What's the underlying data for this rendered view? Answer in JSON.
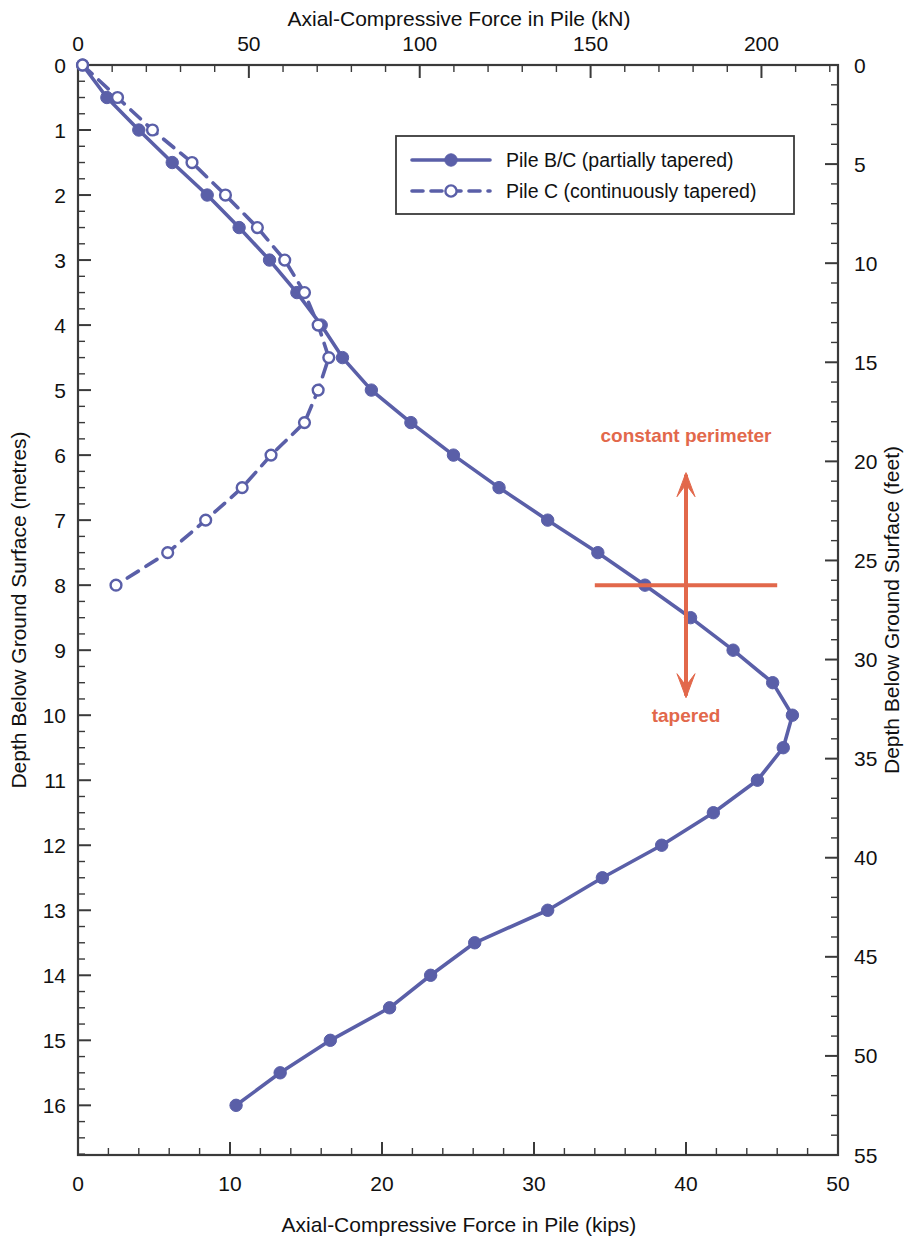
{
  "chart_data": {
    "type": "line",
    "title": "",
    "top_axis": {
      "label": "Axial-Compressive Force in Pile (kN)",
      "ticks": [
        0,
        50,
        100,
        150,
        200
      ],
      "range": [
        0,
        222.4
      ],
      "minor_interval": 10
    },
    "bottom_axis": {
      "label": "Axial-Compressive Force in Pile (kips)",
      "ticks": [
        0,
        10,
        20,
        30,
        40,
        50
      ],
      "range": [
        0,
        50
      ],
      "minor_interval": 2
    },
    "left_axis": {
      "label": "Depth Below Ground Surface (metres)",
      "ticks": [
        0,
        1,
        2,
        3,
        4,
        5,
        6,
        7,
        8,
        9,
        10,
        11,
        12,
        13,
        14,
        15,
        16
      ],
      "range": [
        0,
        16.764
      ],
      "minor_interval": 0.25
    },
    "right_axis": {
      "label": "Depth Below Ground Surface (feet)",
      "ticks": [
        0,
        5,
        10,
        15,
        20,
        25,
        30,
        35,
        40,
        45,
        50,
        55
      ],
      "range": [
        0,
        55
      ],
      "minor_interval": 1
    },
    "xlabel": "Axial-Compressive Force in Pile (kips)",
    "ylabel": "Depth Below Ground Surface (metres)",
    "grid": false,
    "legend_position": "top-center",
    "series": [
      {
        "name": "Pile B/C (partially tapered)",
        "style": "solid",
        "marker": "filled-circle",
        "color": "#5a5fa8",
        "points": [
          {
            "x": 0.3,
            "y": 0.0
          },
          {
            "x": 1.9,
            "y": 0.5
          },
          {
            "x": 4.0,
            "y": 1.0
          },
          {
            "x": 6.2,
            "y": 1.5
          },
          {
            "x": 8.5,
            "y": 2.0
          },
          {
            "x": 10.6,
            "y": 2.5
          },
          {
            "x": 12.6,
            "y": 3.0
          },
          {
            "x": 14.4,
            "y": 3.5
          },
          {
            "x": 16.0,
            "y": 4.0
          },
          {
            "x": 17.4,
            "y": 4.5
          },
          {
            "x": 19.3,
            "y": 5.0
          },
          {
            "x": 21.9,
            "y": 5.5
          },
          {
            "x": 24.7,
            "y": 6.0
          },
          {
            "x": 27.7,
            "y": 6.5
          },
          {
            "x": 30.9,
            "y": 7.0
          },
          {
            "x": 34.2,
            "y": 7.5
          },
          {
            "x": 37.3,
            "y": 8.0
          },
          {
            "x": 40.3,
            "y": 8.5
          },
          {
            "x": 43.1,
            "y": 9.0
          },
          {
            "x": 45.7,
            "y": 9.5
          },
          {
            "x": 47.0,
            "y": 10.0
          },
          {
            "x": 46.4,
            "y": 10.5
          },
          {
            "x": 44.7,
            "y": 11.0
          },
          {
            "x": 41.8,
            "y": 11.5
          },
          {
            "x": 38.4,
            "y": 12.0
          },
          {
            "x": 34.5,
            "y": 12.5
          },
          {
            "x": 30.9,
            "y": 13.0
          },
          {
            "x": 26.1,
            "y": 13.5
          },
          {
            "x": 23.2,
            "y": 14.0
          },
          {
            "x": 20.5,
            "y": 14.5
          },
          {
            "x": 16.6,
            "y": 15.0
          },
          {
            "x": 13.3,
            "y": 15.5
          },
          {
            "x": 10.4,
            "y": 16.0
          }
        ]
      },
      {
        "name": "Pile C (continuously tapered)",
        "style": "dashed",
        "marker": "open-circle",
        "color": "#5a5fa8",
        "points": [
          {
            "x": 0.3,
            "y": 0.0
          },
          {
            "x": 2.6,
            "y": 0.5
          },
          {
            "x": 4.9,
            "y": 1.0
          },
          {
            "x": 7.5,
            "y": 1.5
          },
          {
            "x": 9.7,
            "y": 2.0
          },
          {
            "x": 11.8,
            "y": 2.5
          },
          {
            "x": 13.6,
            "y": 3.0
          },
          {
            "x": 14.9,
            "y": 3.5
          },
          {
            "x": 15.8,
            "y": 4.0
          },
          {
            "x": 16.5,
            "y": 4.5
          },
          {
            "x": 15.8,
            "y": 5.0
          },
          {
            "x": 14.9,
            "y": 5.5
          },
          {
            "x": 12.7,
            "y": 6.0
          },
          {
            "x": 10.8,
            "y": 6.5
          },
          {
            "x": 8.4,
            "y": 7.0
          },
          {
            "x": 5.9,
            "y": 7.5
          },
          {
            "x": 2.5,
            "y": 8.0
          }
        ]
      }
    ],
    "annotations": [
      {
        "id": "constant-perimeter",
        "text": "constant perimeter",
        "color": "#e2684b",
        "x": 40.0,
        "y_text": 5.8,
        "y_from": 8.0,
        "y_to": 6.3,
        "direction": "up"
      },
      {
        "id": "tapered",
        "text": "tapered",
        "color": "#e2684b",
        "x": 40.0,
        "y_text": 10.1,
        "y_from": 8.0,
        "y_to": 9.7,
        "direction": "down"
      },
      {
        "id": "boundary-bar",
        "text": "",
        "color": "#e2684b",
        "x_from": 34.0,
        "x_to": 46.0,
        "y": 8.0
      }
    ]
  },
  "legend": {
    "entries": [
      {
        "label": "Pile B/C (partially tapered)",
        "style": "solid",
        "marker": "filled-circle"
      },
      {
        "label": "Pile C (continuously tapered)",
        "style": "dashed",
        "marker": "open-circle"
      }
    ]
  },
  "colors": {
    "series": "#5a5fa8",
    "annotation": "#e2684b",
    "axis": "#3a3a3a",
    "text": "#111111",
    "background": "#ffffff"
  }
}
